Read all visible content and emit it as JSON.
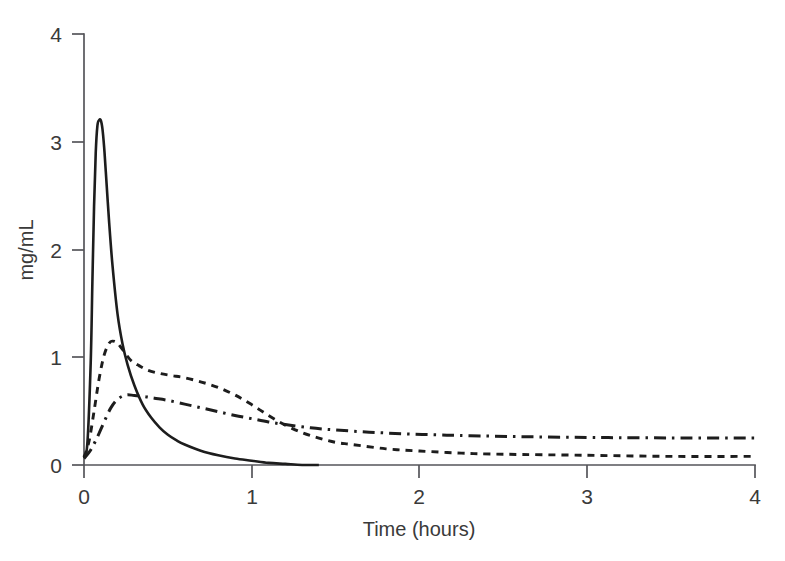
{
  "chart_data": {
    "type": "line",
    "title": "",
    "subtitle": "",
    "xlabel": "Time (hours)",
    "ylabel": "mg/mL",
    "xlim": [
      0,
      4
    ],
    "ylim": [
      0,
      4
    ],
    "xticks": [
      "0",
      "1",
      "2",
      "3",
      "4"
    ],
    "yticks": [
      "0",
      "1",
      "2",
      "3",
      "4"
    ],
    "xtick_values": [
      0,
      1,
      2,
      3,
      4
    ],
    "ytick_values": [
      0,
      1,
      2,
      3,
      4
    ],
    "grid": false,
    "legend": "none",
    "annotations": [],
    "series": [
      {
        "name": "Formulation 1",
        "style": "solid",
        "color": "#1d1d1d",
        "peak_value": 3.2,
        "peak_time": 0.1,
        "plateau_value": 0.0,
        "x": [
          0.0,
          0.02,
          0.04,
          0.05,
          0.06,
          0.07,
          0.08,
          0.09,
          0.1,
          0.11,
          0.12,
          0.13,
          0.15,
          0.17,
          0.2,
          0.23,
          0.26,
          0.3,
          0.35,
          0.4,
          0.45,
          0.5,
          0.55,
          0.6,
          0.7,
          0.8,
          0.9,
          1.0,
          1.1,
          1.2,
          1.3,
          1.4
        ],
        "y": [
          0.08,
          0.2,
          0.95,
          1.7,
          2.4,
          2.9,
          3.15,
          3.2,
          3.2,
          3.12,
          2.95,
          2.72,
          2.25,
          1.85,
          1.4,
          1.12,
          0.93,
          0.74,
          0.56,
          0.44,
          0.35,
          0.28,
          0.23,
          0.19,
          0.13,
          0.09,
          0.06,
          0.04,
          0.02,
          0.01,
          0.0,
          0.0
        ]
      },
      {
        "name": "Formulation 2",
        "style": "dashed",
        "color": "#1d1d1d",
        "peak_value": 1.15,
        "peak_time": 0.17,
        "plateau_value": 0.08,
        "x": [
          0.0,
          0.03,
          0.06,
          0.09,
          0.12,
          0.15,
          0.17,
          0.2,
          0.24,
          0.28,
          0.33,
          0.38,
          0.45,
          0.52,
          0.6,
          0.7,
          0.8,
          0.9,
          1.0,
          1.1,
          1.2,
          1.3,
          1.4,
          1.5,
          1.6,
          1.8,
          2.0,
          2.25,
          2.5,
          3.0,
          3.5,
          4.0
        ],
        "y": [
          0.07,
          0.22,
          0.5,
          0.8,
          1.02,
          1.13,
          1.15,
          1.13,
          1.05,
          0.97,
          0.92,
          0.88,
          0.85,
          0.83,
          0.81,
          0.77,
          0.72,
          0.65,
          0.56,
          0.46,
          0.37,
          0.3,
          0.25,
          0.21,
          0.19,
          0.15,
          0.13,
          0.11,
          0.1,
          0.09,
          0.08,
          0.08
        ]
      },
      {
        "name": "Formulation 3",
        "style": "dashdot",
        "color": "#1d1d1d",
        "peak_value": 0.65,
        "peak_time": 0.25,
        "plateau_value": 0.25,
        "x": [
          0.0,
          0.04,
          0.08,
          0.12,
          0.16,
          0.2,
          0.25,
          0.3,
          0.36,
          0.42,
          0.5,
          0.6,
          0.7,
          0.8,
          0.9,
          1.0,
          1.1,
          1.2,
          1.35,
          1.5,
          1.7,
          1.9,
          2.1,
          2.3,
          2.6,
          3.0,
          3.4,
          4.0
        ],
        "y": [
          0.06,
          0.14,
          0.26,
          0.4,
          0.53,
          0.61,
          0.65,
          0.645,
          0.635,
          0.62,
          0.6,
          0.565,
          0.53,
          0.495,
          0.46,
          0.43,
          0.4,
          0.375,
          0.345,
          0.325,
          0.305,
          0.29,
          0.28,
          0.272,
          0.263,
          0.256,
          0.252,
          0.25
        ]
      }
    ]
  },
  "axes": {
    "x_title": "Time (hours)",
    "y_title": "mg/mL"
  }
}
